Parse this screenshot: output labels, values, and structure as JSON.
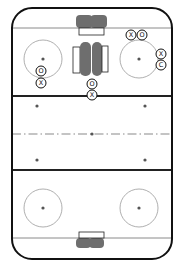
{
  "diagram": {
    "colors": {
      "background": "#ffffff",
      "boards": "#111111",
      "goal_line": "#8a8a8a",
      "blue_line": "#222222",
      "center_line": "#8a8a8a",
      "faceoff_circle": "#9a9a9a",
      "dot": "#555555",
      "equipment": "#6e6e6e",
      "player_ring": "#111111"
    },
    "rink": {
      "x": 12,
      "y": 8,
      "width": 160,
      "height": 251,
      "corner_radius": 20
    },
    "lines": {
      "goal_top_y": 28,
      "goal_bottom_y": 238,
      "blue_top_y": 96,
      "blue_bottom_y": 170,
      "center_y": 134
    },
    "faceoff_circles": [
      {
        "name": "top-left",
        "cx": 43,
        "cy": 59,
        "r": 19
      },
      {
        "name": "top-right",
        "cx": 139,
        "cy": 59,
        "r": 19
      },
      {
        "name": "bottom-left",
        "cx": 43,
        "cy": 208,
        "r": 19
      },
      {
        "name": "bottom-right",
        "cx": 139,
        "cy": 208,
        "r": 19
      }
    ],
    "neutral_dots": [
      {
        "cx": 37,
        "cy": 106
      },
      {
        "cx": 145,
        "cy": 106
      },
      {
        "cx": 92,
        "cy": 134
      },
      {
        "cx": 37,
        "cy": 160
      },
      {
        "cx": 145,
        "cy": 160
      }
    ],
    "goals": [
      {
        "name": "top-goal",
        "net": {
          "x": 79,
          "y": 28,
          "w": 25,
          "h": 7
        },
        "blob": {
          "x": 76,
          "y": 15,
          "w": 31,
          "h": 13
        }
      },
      {
        "name": "bottom-goal",
        "net": {
          "x": 79,
          "y": 232,
          "w": 25,
          "h": 6
        },
        "blob": {
          "x": 76,
          "y": 238,
          "w": 28,
          "h": 10
        }
      }
    ],
    "center_equipment": {
      "left_rect": {
        "x": 73,
        "y": 47,
        "w": 7,
        "h": 26
      },
      "left_blob": {
        "x": 80,
        "y": 42,
        "w": 11,
        "h": 34
      },
      "right_blob": {
        "x": 92,
        "y": 42,
        "w": 10,
        "h": 34
      },
      "right_rect": {
        "x": 102,
        "y": 46,
        "w": 6,
        "h": 26
      }
    },
    "players": [
      {
        "label": "X",
        "team": "offense",
        "cx": 131,
        "cy": 35
      },
      {
        "label": "O",
        "team": "defense",
        "cx": 142,
        "cy": 35
      },
      {
        "label": "X",
        "team": "offense",
        "cx": 161,
        "cy": 54
      },
      {
        "label": "C",
        "team": "coach",
        "cx": 161,
        "cy": 65
      },
      {
        "label": "O",
        "team": "defense",
        "cx": 41,
        "cy": 71
      },
      {
        "label": "X",
        "team": "offense",
        "cx": 41,
        "cy": 83
      },
      {
        "label": "O",
        "team": "defense",
        "cx": 92,
        "cy": 84
      },
      {
        "label": "X",
        "team": "offense",
        "cx": 92,
        "cy": 95
      }
    ],
    "player_radius": 5
  }
}
